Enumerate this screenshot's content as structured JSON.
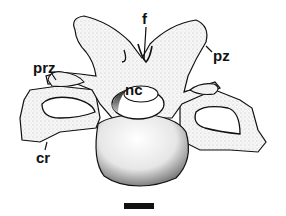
{
  "figure": {
    "colors": {
      "ink": "#111111",
      "bone": "#f4f4f4",
      "shade": "#9a9a9a",
      "background": "#ffffff"
    },
    "labels": [
      {
        "id": "f",
        "text": "f",
        "x": 146,
        "y": 24
      },
      {
        "id": "pz",
        "text": "pz",
        "x": 212,
        "y": 61
      },
      {
        "id": "prz",
        "text": "prz",
        "x": 34,
        "y": 73
      },
      {
        "id": "nc",
        "text": "nc",
        "x": 124,
        "y": 92
      },
      {
        "id": "cr",
        "text": "cr",
        "x": 36,
        "y": 163
      }
    ],
    "scale_bar": {
      "x": 124,
      "y": 203,
      "width": 30,
      "height": 6
    }
  }
}
